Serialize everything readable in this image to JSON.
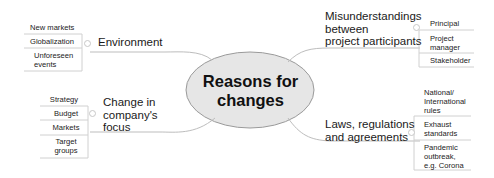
{
  "diagram": {
    "type": "mind-map",
    "center": {
      "label": "Reasons for\nchanges",
      "fill": "#e6e6e6",
      "stroke": "#9a9a9a"
    },
    "branches": [
      {
        "id": "environment",
        "label": "Environment",
        "side": "left",
        "children": [
          "New markets",
          "Globalization",
          "Unforeseen\nevents"
        ]
      },
      {
        "id": "company-focus",
        "label": "Change in\ncompany's\nfocus",
        "side": "left",
        "children": [
          "Strategy",
          "Budget",
          "Markets",
          "Target\ngroups"
        ]
      },
      {
        "id": "misunderstandings",
        "label": "Misunderstandings\nbetween\nproject participants",
        "side": "right",
        "children": [
          "Principal",
          "Project\nmanager",
          "Stakeholder"
        ]
      },
      {
        "id": "laws",
        "label": "Laws, regulations\nand agreements",
        "side": "right",
        "children": [
          "National/\nInternational\nrules",
          "Exhaust\nstandards",
          "Pandemic\noutbreak,\ne.g. Corona"
        ]
      }
    ],
    "colors": {
      "line": "#bdbdbd",
      "box_border": "#d0d0d0",
      "text": "#1a1a1a"
    }
  }
}
